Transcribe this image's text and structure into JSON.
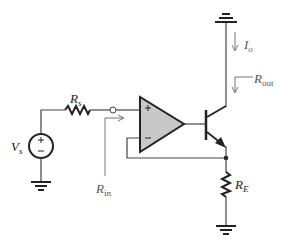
{
  "diagram": {
    "type": "circuit",
    "colors": {
      "wire": "#222222",
      "annotation": "#777777",
      "opamp_fill": "#c8c8c8"
    },
    "labels": {
      "source_resistor": {
        "main": "R",
        "sub": "s"
      },
      "source_voltage": {
        "main": "V",
        "sub": "s"
      },
      "input_resistance": {
        "main": "R",
        "sub": "in"
      },
      "output_resistance": {
        "main": "R",
        "sub": "out"
      },
      "output_current": {
        "main": "I",
        "sub": "o"
      },
      "emitter_resistor": {
        "main": "R",
        "sub": "E"
      },
      "opamp_plus": "+",
      "opamp_minus": "−",
      "source_plus": "+",
      "source_minus": "−"
    },
    "components": [
      {
        "id": "Vs",
        "kind": "voltage-source"
      },
      {
        "id": "Rs",
        "kind": "resistor"
      },
      {
        "id": "opamp",
        "kind": "op-amp"
      },
      {
        "id": "Q",
        "kind": "npn-transistor"
      },
      {
        "id": "RE",
        "kind": "resistor"
      },
      {
        "id": "gnd1",
        "kind": "ground"
      },
      {
        "id": "gnd2",
        "kind": "ground"
      },
      {
        "id": "gnd3",
        "kind": "ground"
      }
    ]
  }
}
